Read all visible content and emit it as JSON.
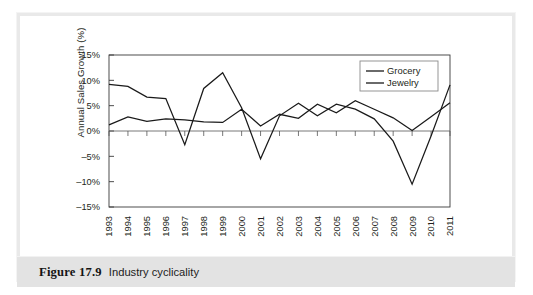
{
  "figure": {
    "caption_number": "Figure 17.9",
    "caption_title": "Industry cyclicality"
  },
  "chart_data": {
    "type": "line",
    "title": "",
    "xlabel": "",
    "ylabel": "Annual Sales Growth (%)",
    "categories": [
      "1993",
      "1994",
      "1995",
      "1996",
      "1997",
      "1998",
      "1999",
      "2000",
      "2001",
      "2002",
      "2003",
      "2004",
      "2005",
      "2006",
      "2007",
      "2008",
      "2009",
      "2010",
      "2011"
    ],
    "ylim": [
      -15,
      15
    ],
    "ytick_labels": [
      "15%",
      "10%",
      "5%",
      "0%",
      "-5%",
      "-10%",
      "-15%"
    ],
    "ytick_values": [
      15,
      10,
      5,
      0,
      -5,
      -10,
      -15
    ],
    "grid": false,
    "legend_position": "top-right",
    "series": [
      {
        "name": "Grocery",
        "values": [
          1.2,
          2.8,
          1.9,
          2.4,
          2.2,
          1.8,
          1.7,
          4.3,
          1.0,
          3.3,
          2.5,
          5.3,
          3.6,
          6.0,
          4.3,
          2.6,
          0.1,
          2.8,
          5.6
        ]
      },
      {
        "name": "Jewelry",
        "values": [
          9.2,
          8.8,
          6.7,
          6.4,
          -2.7,
          8.4,
          11.5,
          4.6,
          -5.5,
          3.0,
          5.5,
          3.0,
          5.3,
          4.3,
          2.4,
          -2.0,
          -10.5,
          -1.0,
          9.1
        ]
      }
    ]
  },
  "legend": {
    "items": [
      {
        "label": "Grocery"
      },
      {
        "label": "Jewelry"
      }
    ]
  }
}
